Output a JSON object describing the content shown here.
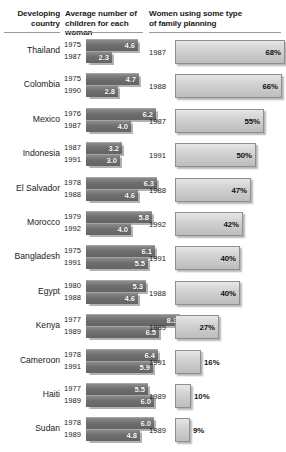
{
  "header": {
    "col_country": "Developing\ncountry",
    "col_country_line1": "Developing",
    "col_country_line2": "country",
    "col_children_line1": "Average number of",
    "col_children_line2": "children for each woman",
    "col_planning_line1": "Women using some type",
    "col_planning_line2": "of family planning"
  },
  "colors": {
    "fertility_bar": "#6e6e6e",
    "planning_bar": "#d2d2d2",
    "rule": "#9a9a9a",
    "text": "#1a1a1a",
    "fertility_value_text": "#ffffff",
    "planning_value_text": "#111111",
    "background": "#ffffff"
  },
  "chart_data": {
    "type": "bar",
    "xlabel": "",
    "ylabel": "Developing country",
    "orientation": "horizontal",
    "grid": false,
    "legend": "none",
    "panels": [
      {
        "name": "fertility",
        "label": "Average number of children for each woman",
        "units": "children per woman",
        "xlim": [
          0,
          8.3
        ]
      },
      {
        "name": "family_planning",
        "label": "Women using some type of family planning",
        "units": "percent",
        "xlim": [
          0,
          68
        ]
      }
    ],
    "categories": [
      "Thailand",
      "Colombia",
      "Mexico",
      "Indonesia",
      "El Salvador",
      "Morocco",
      "Bangladesh",
      "Egypt",
      "Kenya",
      "Cameroon",
      "Haiti",
      "Sudan"
    ],
    "series": [
      {
        "name": "fertility_earlier",
        "values": [
          4.6,
          4.7,
          6.2,
          3.2,
          6.3,
          5.8,
          6.1,
          5.3,
          8.3,
          6.4,
          5.5,
          6.0
        ]
      },
      {
        "name": "fertility_later",
        "values": [
          2.3,
          2.8,
          4.0,
          3.0,
          4.6,
          4.0,
          5.5,
          4.6,
          6.5,
          5.9,
          6.0,
          4.8
        ]
      },
      {
        "name": "family_planning_percent",
        "values": [
          68,
          66,
          55,
          50,
          47,
          42,
          40,
          40,
          27,
          16,
          10,
          9
        ]
      }
    ]
  },
  "rows": [
    {
      "country": "Thailand",
      "fertility": [
        {
          "year": "1975",
          "value": "4.6",
          "num": 4.6
        },
        {
          "year": "1987",
          "value": "2.3",
          "num": 2.3
        }
      ],
      "planning": {
        "year": "1987",
        "value": "68%",
        "num": 68
      }
    },
    {
      "country": "Colombia",
      "fertility": [
        {
          "year": "1975",
          "value": "4.7",
          "num": 4.7
        },
        {
          "year": "1990",
          "value": "2.8",
          "num": 2.8
        }
      ],
      "planning": {
        "year": "1988",
        "value": "66%",
        "num": 66
      }
    },
    {
      "country": "Mexico",
      "fertility": [
        {
          "year": "1976",
          "value": "6.2",
          "num": 6.2
        },
        {
          "year": "1987",
          "value": "4.0",
          "num": 4.0
        }
      ],
      "planning": {
        "year": "1987",
        "value": "55%",
        "num": 55
      }
    },
    {
      "country": "Indonesia",
      "fertility": [
        {
          "year": "1987",
          "value": "3.2",
          "num": 3.2
        },
        {
          "year": "1991",
          "value": "3.0",
          "num": 3.0
        }
      ],
      "planning": {
        "year": "1991",
        "value": "50%",
        "num": 50
      }
    },
    {
      "country": "El Salvador",
      "fertility": [
        {
          "year": "1978",
          "value": "6.3",
          "num": 6.3
        },
        {
          "year": "1988",
          "value": "4.6",
          "num": 4.6
        }
      ],
      "planning": {
        "year": "1988",
        "value": "47%",
        "num": 47
      }
    },
    {
      "country": "Morocco",
      "fertility": [
        {
          "year": "1979",
          "value": "5.8",
          "num": 5.8
        },
        {
          "year": "1992",
          "value": "4.0",
          "num": 4.0
        }
      ],
      "planning": {
        "year": "1992",
        "value": "42%",
        "num": 42
      }
    },
    {
      "country": "Bangladesh",
      "fertility": [
        {
          "year": "1975",
          "value": "6.1",
          "num": 6.1
        },
        {
          "year": "1991",
          "value": "5.5",
          "num": 5.5
        }
      ],
      "planning": {
        "year": "1991",
        "value": "40%",
        "num": 40
      }
    },
    {
      "country": "Egypt",
      "fertility": [
        {
          "year": "1980",
          "value": "5.3",
          "num": 5.3
        },
        {
          "year": "1988",
          "value": "4.6",
          "num": 4.6
        }
      ],
      "planning": {
        "year": "1988",
        "value": "40%",
        "num": 40
      }
    },
    {
      "country": "Kenya",
      "fertility": [
        {
          "year": "1977",
          "value": "8.3",
          "num": 8.3
        },
        {
          "year": "1989",
          "value": "6.5",
          "num": 6.5
        }
      ],
      "planning": {
        "year": "1989",
        "value": "27%",
        "num": 27
      }
    },
    {
      "country": "Cameroon",
      "fertility": [
        {
          "year": "1978",
          "value": "6.4",
          "num": 6.4
        },
        {
          "year": "1991",
          "value": "5.9",
          "num": 5.9
        }
      ],
      "planning": {
        "year": "1991",
        "value": "16%",
        "num": 16
      }
    },
    {
      "country": "Haiti",
      "fertility": [
        {
          "year": "1977",
          "value": "5.5",
          "num": 5.5
        },
        {
          "year": "1989",
          "value": "6.0",
          "num": 6.0
        }
      ],
      "planning": {
        "year": "1989",
        "value": "10%",
        "num": 10
      }
    },
    {
      "country": "Sudan",
      "fertility": [
        {
          "year": "1978",
          "value": "6.0",
          "num": 6.0
        },
        {
          "year": "1989",
          "value": "4.8",
          "num": 4.8
        }
      ],
      "planning": {
        "year": "1989",
        "value": "9%",
        "num": 9
      }
    }
  ]
}
